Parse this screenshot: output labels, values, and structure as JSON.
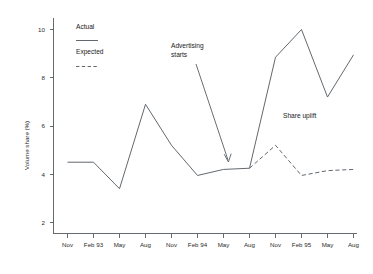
{
  "chart_data": {
    "type": "line",
    "title": "",
    "xlabel": "",
    "ylabel": "Volume share (%)",
    "ylim": [
      2,
      10
    ],
    "yticks": [
      2,
      4,
      6,
      8,
      10
    ],
    "grid": false,
    "legend_position": "top-left-inside",
    "categories": [
      "Nov",
      "Feb 93",
      "May",
      "Aug",
      "Nov",
      "Feb 94",
      "May",
      "Aug",
      "Nov",
      "Feb 95",
      "May",
      "Aug"
    ],
    "series": [
      {
        "name": "Actual",
        "style": "solid",
        "color": "#5a6066",
        "x": [
          "Nov",
          "Feb 93",
          "May",
          "Aug",
          "Nov",
          "Feb 94",
          "May",
          "Aug",
          "Nov",
          "Feb 95",
          "May",
          "Aug"
        ],
        "values": [
          4.5,
          4.5,
          3.4,
          6.9,
          5.2,
          3.95,
          4.2,
          4.25,
          8.85,
          10.0,
          7.2,
          8.95
        ]
      },
      {
        "name": "Expected",
        "style": "dashed",
        "color": "#5a6066",
        "x": [
          "Aug",
          "Nov",
          "Feb 95",
          "May",
          "Aug"
        ],
        "values": [
          4.25,
          5.2,
          3.95,
          4.15,
          4.2
        ]
      }
    ],
    "annotations": [
      {
        "text_line_1": "Advertising",
        "text_line_2": "starts",
        "kind": "arrow-callout",
        "points_to_category": "Aug",
        "points_to_value": 4.25
      },
      {
        "text_line_1": "Share uplift",
        "text_line_2": "",
        "kind": "text-label"
      }
    ]
  },
  "legend": {
    "actual": {
      "label": "Actual",
      "swatch": "solid-line-swatch"
    },
    "expected": {
      "label": "Expected",
      "swatch": "dashed-line-swatch"
    }
  },
  "axes": {
    "y_title": "Volume share (%)",
    "y_tick_labels": [
      "10",
      "8",
      "6",
      "4",
      "2"
    ],
    "x_tick_labels": [
      "Nov",
      "Feb 93",
      "May",
      "Aug",
      "Nov",
      "Feb 94",
      "May",
      "Aug",
      "Nov",
      "Feb 95",
      "May",
      "Aug"
    ]
  },
  "annotations": {
    "advertising_starts_line1": "Advertising",
    "advertising_starts_line2": "starts",
    "share_uplift": "Share uplift"
  },
  "colors": {
    "line": "#5a6066",
    "axis": "#555b5f",
    "text": "#1a1a1a",
    "background": "#ffffff"
  }
}
